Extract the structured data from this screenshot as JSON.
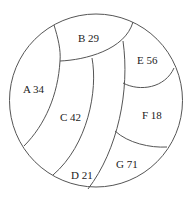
{
  "diagram": {
    "type": "circle-partition",
    "regions": [
      {
        "id": "A",
        "label": "A 34",
        "value": 34
      },
      {
        "id": "B",
        "label": "B 29",
        "value": 29
      },
      {
        "id": "C",
        "label": "C 42",
        "value": 42
      },
      {
        "id": "D",
        "label": "D 21",
        "value": 21
      },
      {
        "id": "E",
        "label": "E 56",
        "value": 56
      },
      {
        "id": "F",
        "label": "F 18",
        "value": 18
      },
      {
        "id": "G",
        "label": "G 71",
        "value": 71
      }
    ],
    "colors": {
      "stroke": "#555555",
      "text": "#222222",
      "background": "#ffffff"
    }
  }
}
